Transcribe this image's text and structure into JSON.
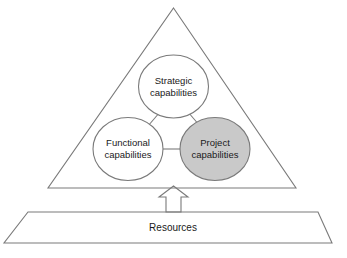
{
  "diagram": {
    "type": "pyramid-capabilities-diagram",
    "background_color": "#ffffff",
    "stroke_color": "#7a7a7a",
    "text_color": "#1a1a1a",
    "triangle": {
      "name": "capabilities-triangle",
      "fill": "#ffffff"
    },
    "nodes": [
      {
        "id": "strategic",
        "line1": "Strategic",
        "line2": "capabilities",
        "fill": "#ffffff",
        "highlighted": false
      },
      {
        "id": "functional",
        "line1": "Functional",
        "line2": "capabilities",
        "fill": "#ffffff",
        "highlighted": false
      },
      {
        "id": "project",
        "line1": "Project",
        "line2": "capabilities",
        "fill": "#c9c9c9",
        "highlighted": true
      }
    ],
    "arrow": {
      "name": "upward-arrow",
      "direction": "up",
      "fill": "#ffffff"
    },
    "base": {
      "name": "resources-base",
      "label": "Resources",
      "fill": "#ffffff"
    }
  }
}
